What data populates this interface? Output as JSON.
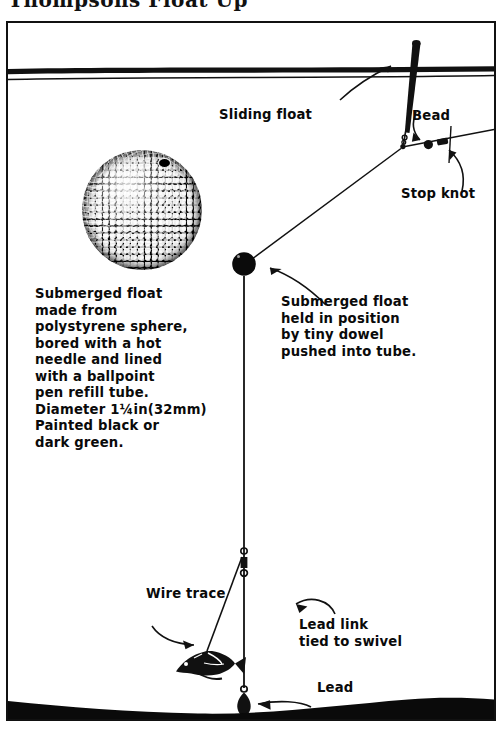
{
  "page": {
    "clipped_header_text": "Thompsons Float Up",
    "diagram_title": "Sliding float rig with submerged float"
  },
  "labels": {
    "sliding_float": "Sliding float",
    "bead": "Bead",
    "stop_knot": "Stop knot",
    "wire_trace": "Wire trace",
    "lead": "Lead",
    "lead_link": "Lead link\ntied to swivel"
  },
  "notes": {
    "left_block": "Submerged float\nmade from\npolystyrene sphere,\nbored with a hot\nneedle and lined\nwith a ballpoint\npen refill tube.\nDiameter 1¼in(32mm)\nPainted black or\ndark green.",
    "right_block": "Submerged float\nheld in position\nby tiny dowel\npushed into tube."
  },
  "parts": {
    "sphere_label": "polystyrene-sphere-photo",
    "submerged_float_ball": "submerged-float-ball",
    "swivel": "swivel",
    "lead_weight": "lead-weight",
    "bait_fish": "bait-fish",
    "water_surface": "water-surface-line",
    "seabed": "seabed"
  },
  "colors": {
    "ink": "#0a0a0a",
    "paper": "#ffffff",
    "frame": "#111111"
  }
}
